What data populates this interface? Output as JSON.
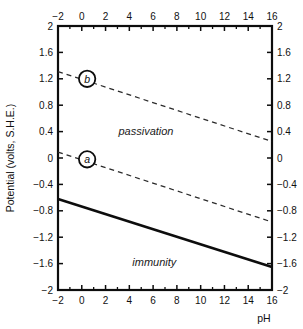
{
  "chart_data": {
    "type": "line",
    "title": "",
    "xlabel": "pH",
    "ylabel": "Potential (volts, S.H.E.)",
    "xlim": [
      -2,
      16
    ],
    "ylim": [
      -2,
      2
    ],
    "grid": false,
    "legend_position": "none",
    "x_ticks": [
      -2,
      0,
      2,
      4,
      6,
      8,
      10,
      12,
      14,
      16
    ],
    "x_tick_labels": [
      "−2",
      "0",
      "2",
      "4",
      "6",
      "8",
      "10",
      "12",
      "14",
      "16"
    ],
    "x_minor_ticks": [
      -1,
      1,
      3,
      5,
      7,
      9,
      11,
      13,
      15
    ],
    "y_ticks": [
      2,
      1.6,
      1.2,
      0.8,
      0.4,
      0,
      -0.4,
      -0.8,
      -1.2,
      -1.6,
      -2
    ],
    "y_tick_labels": [
      "2",
      "1.6",
      "1.2",
      "0.8",
      "0.4",
      "0",
      "−0.4",
      "−0.8",
      "−1.2",
      "−1.6",
      "−2"
    ],
    "top_axis": {
      "visible": true,
      "ticks": [
        -2,
        0,
        2,
        4,
        6,
        8,
        10,
        12,
        14,
        16
      ],
      "tick_labels": [
        "−2",
        "0",
        "2",
        "4",
        "6",
        "8",
        "10",
        "12",
        "14",
        "16"
      ]
    },
    "right_axis": {
      "visible": true,
      "ticks": [
        2,
        1.6,
        1.2,
        0.8,
        0.4,
        0,
        -0.4,
        -0.8,
        -1.2,
        -1.6,
        -2
      ],
      "tick_labels": [
        "2",
        "1.6",
        "1.2",
        "0.8",
        "0.4",
        "0",
        "−0.4",
        "−0.8",
        "−1.2",
        "−1.6",
        "−2"
      ]
    },
    "series": [
      {
        "name": "b",
        "style": "dashed",
        "x": [
          -2,
          16
        ],
        "values": [
          1.31,
          0.25
        ]
      },
      {
        "name": "a",
        "style": "dashed",
        "x": [
          -2,
          16
        ],
        "values": [
          0.09,
          -0.97
        ]
      },
      {
        "name": "equilibrium",
        "style": "solid",
        "x": [
          -2,
          16
        ],
        "values": [
          -0.62,
          -1.65
        ]
      }
    ],
    "point_markers": [
      {
        "label": "b",
        "x": 0.45,
        "y": 1.2
      },
      {
        "label": "a",
        "x": 0.45,
        "y": -0.02
      }
    ],
    "annotations": [
      {
        "text": "passivation",
        "x": 5.4,
        "y": 0.35
      },
      {
        "text": "immunity",
        "x": 6.1,
        "y": -1.63
      }
    ]
  },
  "colors": {
    "axis": "#0d0d0d",
    "solid_line": "#0d0d0d",
    "dashed_line": "#2b2b2b",
    "background": "#ffffff"
  }
}
